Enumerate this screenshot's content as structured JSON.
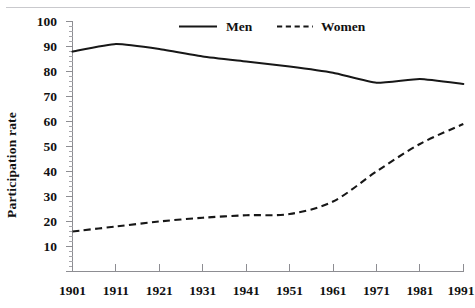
{
  "chart_data": {
    "type": "line",
    "title": "",
    "subtitle": "",
    "xlabel": "",
    "ylabel": "Participation rate",
    "xlim": [
      1901,
      1991
    ],
    "ylim": [
      0,
      100
    ],
    "grid": false,
    "legend_position": "top-center",
    "x_tick_labels": [
      "1901",
      "1911",
      "1921",
      "1931",
      "1941",
      "1951",
      "1961",
      "1971",
      "1981",
      "1991"
    ],
    "y_tick_labels": [
      "10",
      "20",
      "30",
      "40",
      "50",
      "60",
      "70",
      "80",
      "90",
      "100"
    ],
    "y_major_ticks": [
      10,
      20,
      30,
      40,
      50,
      60,
      70,
      80,
      90,
      100
    ],
    "y_minor_tick_interval": 2,
    "x": [
      1901,
      1911,
      1921,
      1931,
      1941,
      1951,
      1961,
      1971,
      1981,
      1991
    ],
    "series": [
      {
        "name": "Men",
        "style": "solid",
        "color": "#171717",
        "values": [
          88,
          91,
          89,
          86,
          84,
          82,
          79.5,
          75.5,
          77,
          75
        ]
      },
      {
        "name": "Women",
        "style": "dashed",
        "color": "#171717",
        "values": [
          16,
          18,
          20,
          21.5,
          22.5,
          23,
          28,
          40,
          51,
          59
        ]
      }
    ]
  },
  "legend": {
    "items": [
      {
        "label": "Men",
        "style": "solid"
      },
      {
        "label": "Women",
        "style": "dashed"
      }
    ]
  },
  "axes": {
    "y_axis_title": "Participation rate"
  },
  "colors": {
    "line": "#171717",
    "axis": "#8d8d92",
    "top_rule": "#c9c9cd",
    "background": "#ffffff",
    "text": "#111111"
  }
}
